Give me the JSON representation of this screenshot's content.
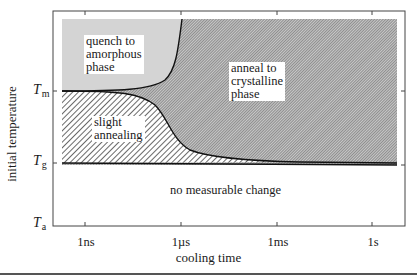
{
  "diagram": {
    "type": "phase-map",
    "x_axis": {
      "title": "cooling time",
      "ticks": [
        "1ns",
        "1µs",
        "1ms",
        "1s"
      ]
    },
    "y_axis": {
      "title": "initial temperature",
      "ticks": [
        {
          "symbol": "T",
          "sub": "m"
        },
        {
          "symbol": "T",
          "sub": "g"
        },
        {
          "symbol": "T",
          "sub": "a"
        }
      ]
    },
    "regions": {
      "quench": [
        "quench to",
        "amorphous",
        "phase"
      ],
      "anneal": [
        "anneal to",
        "crystalline",
        "phase"
      ],
      "slight": [
        "slight",
        "annealing"
      ],
      "none": "no measurable change"
    },
    "colors": {
      "gray_fill": "#d2d2d2",
      "dense_hatch": "#9a9a9a",
      "line": "#111111"
    }
  }
}
